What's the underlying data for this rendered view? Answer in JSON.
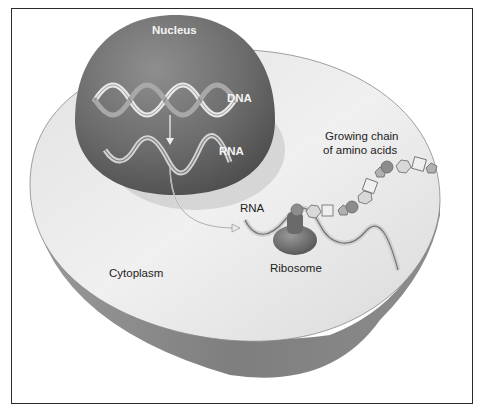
{
  "figure": {
    "labels": {
      "nucleus": "Nucleus",
      "dna": "DNA",
      "rna_nucleus": "RNA",
      "rna_cytoplasm": "RNA",
      "growing_chain_line1": "Growing chain",
      "growing_chain_line2": "of amino acids",
      "ribosome": "Ribosome",
      "cytoplasm": "Cytoplasm"
    },
    "colors": {
      "frame": "#2a2a2a",
      "cytoplasm_top": "#e6e6e6",
      "cytoplasm_side": "#8a8a8a",
      "nucleus": "#6e6e6e",
      "ribosome": "#7a7a7a",
      "amino_light": "#d8d8d8",
      "amino_dark": "#8c8c8c"
    }
  }
}
